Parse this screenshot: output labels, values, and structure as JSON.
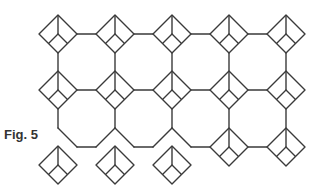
{
  "figure": {
    "label": "Fig. 5",
    "stroke_color": "#3a3a3a",
    "background": "#ffffff"
  },
  "geometry": {
    "diamond_half_size": 19,
    "columns_x": [
      58,
      115,
      172,
      229,
      286
    ],
    "row_centers_y": [
      34,
      90
    ],
    "connected_diamonds": [
      {
        "x": 58,
        "y": 34
      },
      {
        "x": 115,
        "y": 34
      },
      {
        "x": 172,
        "y": 34
      },
      {
        "x": 229,
        "y": 34
      },
      {
        "x": 286,
        "y": 34
      },
      {
        "x": 58,
        "y": 90
      },
      {
        "x": 115,
        "y": 90
      },
      {
        "x": 172,
        "y": 90
      },
      {
        "x": 229,
        "y": 90
      },
      {
        "x": 286,
        "y": 90
      },
      {
        "x": 229,
        "y": 147
      },
      {
        "x": 286,
        "y": 147
      }
    ],
    "loose_diamonds": [
      {
        "x": 58,
        "y": 165
      },
      {
        "x": 115,
        "y": 165
      },
      {
        "x": 172,
        "y": 165
      }
    ]
  }
}
